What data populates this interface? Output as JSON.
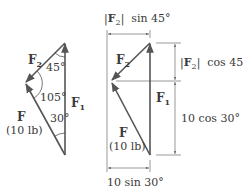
{
  "left_figure": {
    "vectors": {
      "F1": {
        "label": "F",
        "sub": "1"
      },
      "F2": {
        "label": "F",
        "sub": "2"
      },
      "F": {
        "label": "F",
        "magnitude": "(10 lb)"
      }
    },
    "angles": {
      "top": "45°",
      "left": "105°",
      "bottom": "30°"
    }
  },
  "right_figure": {
    "vectors": {
      "F1": {
        "label": "F",
        "sub": "1"
      },
      "F2": {
        "label": "F",
        "sub": "2"
      },
      "F": {
        "label": "F",
        "magnitude": "(10 lb)"
      }
    },
    "dimensions": {
      "top_horizontal": {
        "prefix": "|",
        "vec": "F",
        "sub": "2",
        "suffix": "|  sin 45°"
      },
      "upper_vertical": {
        "prefix": "|",
        "vec": "F",
        "sub": "2",
        "suffix": "|  cos 45°"
      },
      "lower_vertical": "10 cos 30°",
      "bottom_horizontal": "10 sin 30°"
    }
  },
  "colors": {
    "line": "#555555",
    "text": "#3a3a3a"
  }
}
